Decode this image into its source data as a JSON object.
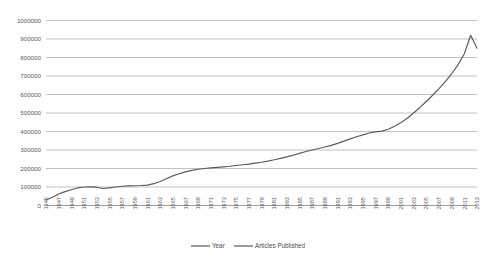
{
  "chart_data": {
    "type": "line",
    "title": "",
    "subtitle": "",
    "xlabel": "",
    "ylabel": "",
    "xlim": [
      1945,
      2013
    ],
    "ylim": [
      0,
      1000000
    ],
    "grid": true,
    "legend_position": "bottom",
    "y_ticks": [
      0,
      100000,
      200000,
      300000,
      400000,
      500000,
      600000,
      700000,
      800000,
      900000,
      1000000
    ],
    "y_tick_labels": [
      "0",
      "100000",
      "200000",
      "300000",
      "400000",
      "500000",
      "600000",
      "700000",
      "800000",
      "900000",
      "1000000"
    ],
    "x_tick_labels": [
      "1945",
      "1947",
      "1949",
      "1951",
      "1953",
      "1955",
      "1957",
      "1959",
      "1961",
      "1963",
      "1965",
      "1967",
      "1969",
      "1971",
      "1973",
      "1975",
      "1977",
      "1979",
      "1981",
      "1983",
      "1985",
      "1987",
      "1989",
      "1991",
      "1993",
      "1995",
      "1997",
      "1999",
      "2001",
      "2003",
      "2005",
      "2007",
      "2009",
      "2011",
      "2013"
    ],
    "legend": [
      "Year",
      "Articles Published"
    ],
    "series": [
      {
        "name": "Articles Published",
        "color": "#5a5a5a",
        "x": [
          1945,
          1946,
          1947,
          1948,
          1949,
          1950,
          1951,
          1952,
          1953,
          1954,
          1955,
          1956,
          1957,
          1958,
          1959,
          1960,
          1961,
          1962,
          1963,
          1964,
          1965,
          1966,
          1967,
          1968,
          1969,
          1970,
          1971,
          1972,
          1973,
          1974,
          1975,
          1976,
          1977,
          1978,
          1979,
          1980,
          1981,
          1982,
          1983,
          1984,
          1985,
          1986,
          1987,
          1988,
          1989,
          1990,
          1991,
          1992,
          1993,
          1994,
          1995,
          1996,
          1997,
          1998,
          1999,
          2000,
          2001,
          2002,
          2003,
          2004,
          2005,
          2006,
          2007,
          2008,
          2009,
          2010,
          2011,
          2012,
          2013
        ],
        "values": [
          30000,
          45000,
          62000,
          75000,
          85000,
          95000,
          100000,
          101000,
          99000,
          92000,
          95000,
          100000,
          104000,
          106000,
          107000,
          108000,
          110000,
          118000,
          130000,
          145000,
          160000,
          172000,
          182000,
          190000,
          196000,
          200000,
          203000,
          206000,
          209000,
          212000,
          216000,
          220000,
          224000,
          229000,
          234000,
          240000,
          247000,
          255000,
          263000,
          272000,
          282000,
          292000,
          300000,
          308000,
          316000,
          325000,
          336000,
          348000,
          360000,
          372000,
          382000,
          392000,
          398000,
          402000,
          412000,
          428000,
          448000,
          472000,
          500000,
          530000,
          562000,
          596000,
          632000,
          670000,
          712000,
          760000,
          820000,
          920000,
          850000
        ]
      }
    ]
  },
  "legend": {
    "item_year": "Year",
    "item_articles": "Articles Published"
  }
}
